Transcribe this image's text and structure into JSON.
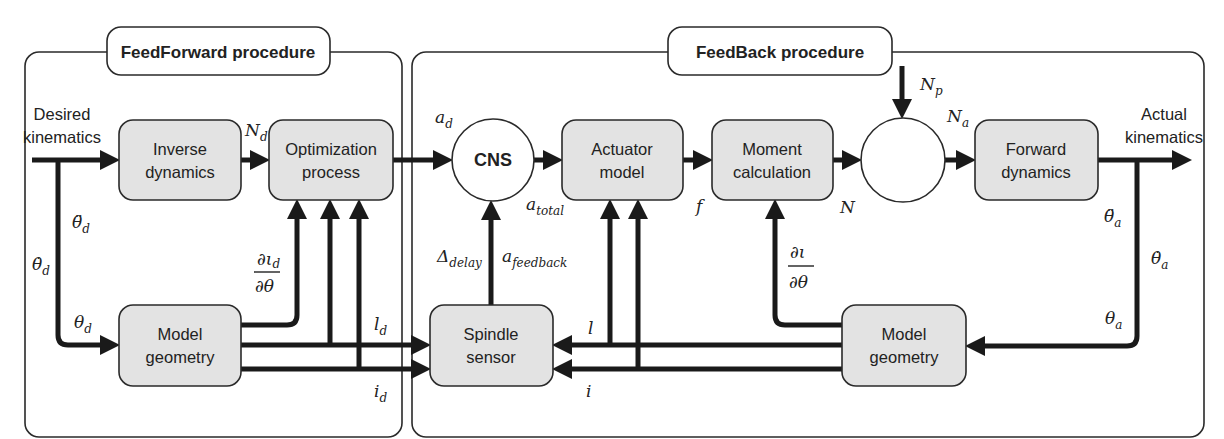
{
  "diagram": {
    "feedforward": {
      "title": "FeedForward procedure",
      "input_label_line1": "Desired",
      "input_label_line2": "kinematics",
      "blocks": {
        "inverse_dynamics": {
          "line1": "Inverse",
          "line2": "dynamics"
        },
        "optimization": {
          "line1": "Optimization",
          "line2": "process"
        },
        "model_geometry": {
          "line1": "Model",
          "line2": "geometry"
        }
      },
      "signals": {
        "N_d": {
          "base": "N",
          "sub": "d"
        },
        "theta_dd_d": {
          "base": "θ̈",
          "sub": "d"
        },
        "theta_d_dot": {
          "base": "θ̇",
          "sub": "d"
        },
        "theta_d": {
          "base": "θ",
          "sub": "d"
        },
        "dl_d_num": "∂ι",
        "dl_d_num_sub": "d",
        "dl_d_den": "∂θ",
        "l_d": {
          "base": "l",
          "sub": "d"
        },
        "i_d": {
          "base": "i",
          "sub": "d"
        }
      }
    },
    "feedback": {
      "title": "FeedBack procedure",
      "output_label_line1": "Actual",
      "output_label_line2": "kinematics",
      "blocks": {
        "cns": "CNS",
        "actuator_model": {
          "line1": "Actuator",
          "line2": "model"
        },
        "moment_calculation": {
          "line1": "Moment",
          "line2": "calculation"
        },
        "summing_junction": "",
        "forward_dynamics": {
          "line1": "Forward",
          "line2": "dynamics"
        },
        "spindle_sensor": {
          "line1": "Spindle",
          "line2": "sensor"
        },
        "model_geometry": {
          "line1": "Model",
          "line2": "geometry"
        }
      },
      "signals": {
        "a_d": {
          "base": "a",
          "sub": "d"
        },
        "a_total": {
          "base": "a",
          "sub": "total"
        },
        "delta_delay": {
          "base": "Δ",
          "sub": "delay"
        },
        "a_feedback": {
          "base": "a",
          "sub": "feedback"
        },
        "f": "f",
        "N": "N",
        "N_p": {
          "base": "N",
          "sub": "p"
        },
        "N_a": {
          "base": "N",
          "sub": "a"
        },
        "dl_num": "∂ι",
        "dl_den": "∂θ",
        "l": "l",
        "i": "i",
        "theta_dd_a": {
          "base": "θ̈",
          "sub": "a"
        },
        "theta_a_dot": {
          "base": "θ̇",
          "sub": "a"
        },
        "theta_a": {
          "base": "θ",
          "sub": "a"
        }
      }
    },
    "colors": {
      "block_fill": "#e3e3e3",
      "stroke": "#1a1a1a",
      "background": "#ffffff"
    }
  }
}
